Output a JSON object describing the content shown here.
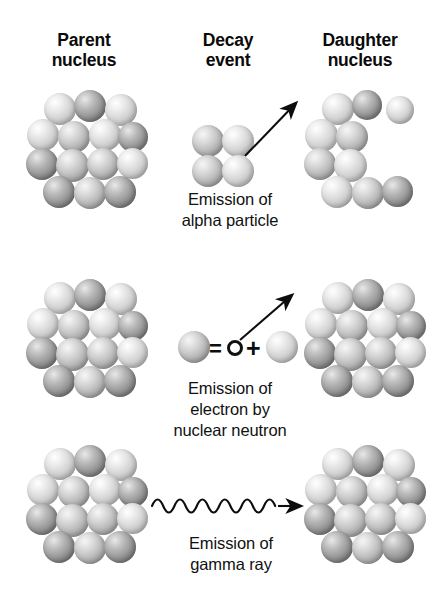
{
  "diagram": {
    "background_color": "#ffffff",
    "ink_color": "#101010"
  },
  "headers": {
    "parent": "Parent\nnucleus",
    "decay": "Decay\nevent",
    "daughter": "Daughter\nnucleus"
  },
  "rows": [
    {
      "id": "alpha-decay",
      "caption": "Emission of\nalpha particle",
      "decay_symbol": "alpha-particle-arrow",
      "parent_nucleon_count": 14,
      "daughter_nucleon_count": 10,
      "emitted_nucleon_count": 4
    },
    {
      "id": "beta-decay",
      "caption": "Emission of\nelectron by\nnuclear neutron",
      "decay_symbol": "neutron-equals-electron-plus-proton",
      "equation": {
        "neutron": "neutron-sphere",
        "equals": "=",
        "electron": "O",
        "plus": "+",
        "proton": "proton-sphere"
      },
      "parent_nucleon_count": 14,
      "daughter_nucleon_count": 14
    },
    {
      "id": "gamma-decay",
      "caption": "Emission of\ngamma  ray",
      "decay_symbol": "gamma-wave-arrow",
      "parent_nucleon_count": 14,
      "daughter_nucleon_count": 14
    }
  ],
  "nucleus_layouts": {
    "full_cluster": [
      {
        "x": 22,
        "y": 5,
        "d": 32,
        "tone": "light"
      },
      {
        "x": 52,
        "y": 2,
        "d": 32,
        "tone": "dark"
      },
      {
        "x": 83,
        "y": 6,
        "d": 32,
        "tone": "light"
      },
      {
        "x": 5,
        "y": 31,
        "d": 32,
        "tone": "light"
      },
      {
        "x": 36,
        "y": 33,
        "d": 32,
        "tone": "mid"
      },
      {
        "x": 67,
        "y": 31,
        "d": 32,
        "tone": "light"
      },
      {
        "x": 96,
        "y": 34,
        "d": 30,
        "tone": "dark"
      },
      {
        "x": 4,
        "y": 60,
        "d": 32,
        "tone": "dark"
      },
      {
        "x": 34,
        "y": 61,
        "d": 33,
        "tone": "mid"
      },
      {
        "x": 65,
        "y": 60,
        "d": 32,
        "tone": "mid"
      },
      {
        "x": 95,
        "y": 60,
        "d": 31,
        "tone": "light"
      },
      {
        "x": 21,
        "y": 88,
        "d": 32,
        "tone": "dark"
      },
      {
        "x": 52,
        "y": 89,
        "d": 32,
        "tone": "mid"
      },
      {
        "x": 82,
        "y": 88,
        "d": 32,
        "tone": "dark"
      }
    ],
    "alpha_depleted_cluster": [
      {
        "x": 22,
        "y": 5,
        "d": 32,
        "tone": "light"
      },
      {
        "x": 52,
        "y": 2,
        "d": 30,
        "tone": "dark"
      },
      {
        "x": 86,
        "y": 8,
        "d": 28,
        "tone": "light"
      },
      {
        "x": 5,
        "y": 31,
        "d": 33,
        "tone": "light"
      },
      {
        "x": 36,
        "y": 33,
        "d": 32,
        "tone": "mid"
      },
      {
        "x": 4,
        "y": 60,
        "d": 32,
        "tone": "mid"
      },
      {
        "x": 34,
        "y": 61,
        "d": 33,
        "tone": "light"
      },
      {
        "x": 21,
        "y": 88,
        "d": 32,
        "tone": "light"
      },
      {
        "x": 52,
        "y": 89,
        "d": 32,
        "tone": "mid"
      },
      {
        "x": 82,
        "y": 88,
        "d": 31,
        "tone": "dark"
      }
    ],
    "alpha_particle": [
      {
        "x": 0,
        "y": 0,
        "d": 32,
        "tone": "mid"
      },
      {
        "x": 30,
        "y": 0,
        "d": 32,
        "tone": "light"
      },
      {
        "x": 0,
        "y": 30,
        "d": 32,
        "tone": "mid"
      },
      {
        "x": 30,
        "y": 30,
        "d": 32,
        "tone": "light"
      }
    ]
  }
}
